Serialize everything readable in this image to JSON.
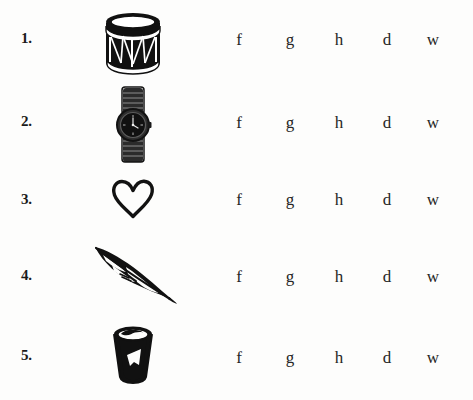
{
  "worksheet": {
    "background_color": "#fdfdfc",
    "ink_color": "#151515",
    "rows": [
      {
        "number": "1.",
        "picture": "drum-icon",
        "picture_label": "drum",
        "choices": [
          "f",
          "g",
          "h",
          "d",
          "w"
        ]
      },
      {
        "number": "2.",
        "picture": "wristwatch-icon",
        "picture_label": "watch",
        "choices": [
          "f",
          "g",
          "h",
          "d",
          "w"
        ]
      },
      {
        "number": "3.",
        "picture": "heart-icon",
        "picture_label": "heart",
        "choices": [
          "f",
          "g",
          "h",
          "d",
          "w"
        ]
      },
      {
        "number": "4.",
        "picture": "feather-icon",
        "picture_label": "feather",
        "choices": [
          "f",
          "g",
          "h",
          "d",
          "w"
        ]
      },
      {
        "number": "5.",
        "picture": "drinking-glass-icon",
        "picture_label": "glass",
        "choices": [
          "f",
          "g",
          "h",
          "d",
          "w"
        ]
      }
    ]
  }
}
